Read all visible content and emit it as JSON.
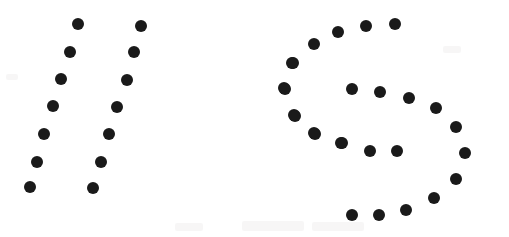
{
  "figure": {
    "width": 509,
    "height": 237,
    "background_color": "#ffffff",
    "dot_color": "#1a1a1a",
    "dot_radius": 6,
    "total_dots": 41
  },
  "groups": [
    {
      "name": "left-glyph-double-slash",
      "label": "//",
      "reading": "two parallel slanted strokes of dots",
      "dot_count": 14,
      "strokes": [
        {
          "name": "stroke-left-slash-outer",
          "dot_count": 7,
          "dots": [
            {
              "x": 78,
              "y": 24
            },
            {
              "x": 70,
              "y": 52
            },
            {
              "x": 61,
              "y": 79
            },
            {
              "x": 53,
              "y": 106
            },
            {
              "x": 44,
              "y": 134
            },
            {
              "x": 37,
              "y": 162
            },
            {
              "x": 30,
              "y": 187
            }
          ]
        },
        {
          "name": "stroke-left-slash-inner",
          "dot_count": 7,
          "dots": [
            {
              "x": 141,
              "y": 26
            },
            {
              "x": 134,
              "y": 52
            },
            {
              "x": 127,
              "y": 80
            },
            {
              "x": 117,
              "y": 107
            },
            {
              "x": 109,
              "y": 134
            },
            {
              "x": 101,
              "y": 162
            },
            {
              "x": 93,
              "y": 188
            }
          ]
        }
      ]
    },
    {
      "name": "right-glyph-letter-s",
      "label": "S",
      "reading": "single S-curve outlined in dots",
      "dot_count": 27,
      "strokes": [
        {
          "name": "stroke-s-top-arc",
          "dot_count": 5,
          "dots": [
            {
              "x": 395,
              "y": 24
            },
            {
              "x": 366,
              "y": 26
            },
            {
              "x": 338,
              "y": 32
            },
            {
              "x": 314,
              "y": 44
            },
            {
              "x": 293,
              "y": 63
            }
          ]
        },
        {
          "name": "stroke-s-upper-left-bowl",
          "dot_count": 4,
          "dots": [
            {
              "x": 284,
              "y": 88
            },
            {
              "x": 294,
              "y": 115
            },
            {
              "x": 315,
              "y": 134
            },
            {
              "x": 342,
              "y": 143
            }
          ]
        },
        {
          "name": "stroke-s-inner-upper-band",
          "dot_count": 4,
          "dots": [
            {
              "x": 352,
              "y": 89
            },
            {
              "x": 380,
              "y": 92
            },
            {
              "x": 409,
              "y": 98
            },
            {
              "x": 436,
              "y": 108
            }
          ]
        },
        {
          "name": "stroke-s-inner-lower-band",
          "dot_count": 4,
          "dots": [
            {
              "x": 314,
              "y": 133
            },
            {
              "x": 341,
              "y": 143
            },
            {
              "x": 370,
              "y": 151
            },
            {
              "x": 397,
              "y": 151
            }
          ]
        },
        {
          "name": "stroke-s-right-bowl",
          "dot_count": 5,
          "dots": [
            {
              "x": 456,
              "y": 127
            },
            {
              "x": 465,
              "y": 153
            },
            {
              "x": 456,
              "y": 179
            },
            {
              "x": 434,
              "y": 198
            },
            {
              "x": 406,
              "y": 210
            }
          ]
        },
        {
          "name": "stroke-s-bottom-arc",
          "dot_count": 2,
          "dots": [
            {
              "x": 379,
              "y": 215
            },
            {
              "x": 352,
              "y": 215
            }
          ]
        },
        {
          "name": "stroke-s-outer-left-edge",
          "dot_count": 3,
          "dots": [
            {
              "x": 292,
              "y": 63
            },
            {
              "x": 285,
              "y": 89
            },
            {
              "x": 295,
              "y": 116
            }
          ]
        }
      ]
    }
  ],
  "artifacts": {
    "caption_smudge_text": "",
    "smudge_color": "#f1efef",
    "bands": [
      {
        "name": "bottom-left-smudge",
        "x": 175,
        "y": 223,
        "width": 28,
        "height": 8
      },
      {
        "name": "bottom-center-smudge",
        "x": 242,
        "y": 221,
        "width": 62,
        "height": 10
      },
      {
        "name": "bottom-right-smudge",
        "x": 312,
        "y": 222,
        "width": 52,
        "height": 9
      },
      {
        "name": "top-right-smudge",
        "x": 443,
        "y": 46,
        "width": 18,
        "height": 7
      },
      {
        "name": "mid-left-smudge",
        "x": 6,
        "y": 74,
        "width": 12,
        "height": 6
      }
    ]
  }
}
